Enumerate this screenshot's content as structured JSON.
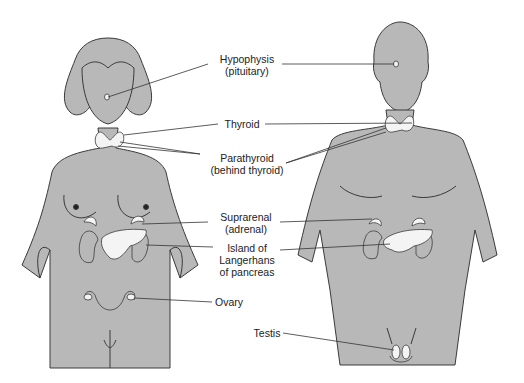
{
  "diagram": {
    "figures": [
      "female",
      "male"
    ],
    "colors": {
      "body_fill": "#b8b8b8",
      "outline": "#3a3a3a",
      "gland_fill": "#f4f4f4",
      "leader_line": "#333333"
    },
    "labels": {
      "hypophysis": {
        "line1": "Hypophysis",
        "line2": "(pituitary)"
      },
      "thyroid": {
        "line1": "Thyroid"
      },
      "parathyroid": {
        "line1": "Parathyroid",
        "line2": "(behind thyroid)"
      },
      "suprarenal": {
        "line1": "Suprarenal",
        "line2": "(adrenal)"
      },
      "islands": {
        "line1": "Island of",
        "line2": "Langerhans",
        "line3": "of pancreas"
      },
      "ovary": {
        "line1": "Ovary"
      },
      "testis": {
        "line1": "Testis"
      }
    }
  }
}
